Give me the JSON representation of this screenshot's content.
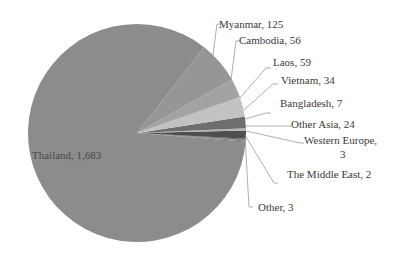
{
  "chart_data": {
    "type": "pie",
    "title": "",
    "legend": "none",
    "labels_format": "category, value",
    "slices": [
      {
        "name": "Thailand",
        "value": 1683,
        "label": "Thailand, 1,683",
        "color": "#8c8c8c"
      },
      {
        "name": "Myanmar",
        "value": 125,
        "label": "Myanmar, 125",
        "color": "#969696"
      },
      {
        "name": "Cambodia",
        "value": 56,
        "label": "Cambodia, 56",
        "color": "#a3a3a3"
      },
      {
        "name": "Laos",
        "value": 59,
        "label": "Laos, 59",
        "color": "#c2c2c2"
      },
      {
        "name": "Vietnam",
        "value": 34,
        "label": "Vietnam, 34",
        "color": "#6e6e6e"
      },
      {
        "name": "Bangladesh",
        "value": 7,
        "label": "Bangladesh, 7",
        "color": "#b5b5b5"
      },
      {
        "name": "Other Asia",
        "value": 24,
        "label": "Other Asia, 24",
        "color": "#4e4e4e"
      },
      {
        "name": "Western Europe",
        "value": 3,
        "label": "Western Europe, 3",
        "color": "#5c5c5c"
      },
      {
        "name": "The Middle East",
        "value": 2,
        "label": "The Middle East, 2",
        "color": "#7a7a7a"
      },
      {
        "name": "Other",
        "value": 3,
        "label": "Other, 3",
        "color": "#6a6a6a"
      }
    ],
    "categories": [
      "Thailand",
      "Myanmar",
      "Cambodia",
      "Laos",
      "Vietnam",
      "Bangladesh",
      "Other Asia",
      "Western Europe",
      "The Middle East",
      "Other"
    ],
    "values": [
      1683,
      125,
      56,
      59,
      34,
      7,
      24,
      3,
      2,
      3
    ],
    "total": 1996
  },
  "labels": {
    "thailand": "Thailand, 1,683",
    "myanmar": "Myanmar, 125",
    "cambodia": "Cambodia, 56",
    "laos": "Laos, 59",
    "vietnam": "Vietnam, 34",
    "bangladesh": "Bangladesh, 7",
    "other_asia": "Other Asia, 24",
    "western_europe_line1": "Western Europe,",
    "western_europe_line2": "3",
    "middle_east": "The Middle East, 2",
    "other": "Other, 3"
  }
}
